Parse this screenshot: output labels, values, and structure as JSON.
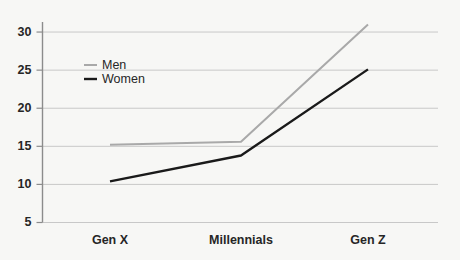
{
  "chart_data": {
    "type": "line",
    "title": "",
    "subtitle": "",
    "xlabel": "",
    "ylabel": "",
    "categories": [
      "Gen X",
      "Millennials",
      "Gen Z"
    ],
    "series": [
      {
        "name": "Men",
        "values": [
          15.2,
          15.6,
          31.0
        ],
        "color": "#a9a9a9"
      },
      {
        "name": "Women",
        "values": [
          10.4,
          13.8,
          25.1
        ],
        "color": "#1a1a1a"
      }
    ],
    "ylim": [
      5,
      32.5
    ],
    "yticks": [
      5,
      10,
      15,
      20,
      25,
      30
    ],
    "ytick_labels": [
      "5",
      "10",
      "15",
      "20",
      "25",
      "30"
    ],
    "grid": true,
    "grid_color": "#c8c8c8",
    "axis_color": "#8c8c8c",
    "background": "#f7f7f5",
    "legend_position": "upper-left-inside",
    "legend": [
      {
        "label": "Men",
        "color": "#a9a9a9"
      },
      {
        "label": "Women",
        "color": "#1a1a1a"
      }
    ]
  }
}
